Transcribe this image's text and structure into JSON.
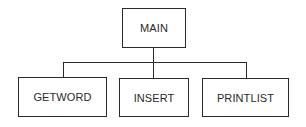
{
  "diagram": {
    "type": "hierarchy-chart",
    "root": {
      "label": "MAIN"
    },
    "children": [
      {
        "label": "GETWORD"
      },
      {
        "label": "INSERT"
      },
      {
        "label": "PRINTLIST"
      }
    ],
    "colors": {
      "stroke": "#2a2a2a",
      "background": "#ffffff",
      "text": "#2a2a2a"
    }
  }
}
